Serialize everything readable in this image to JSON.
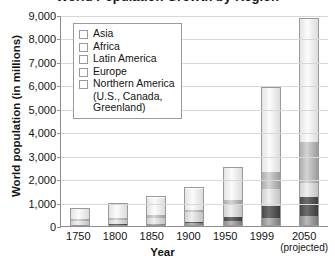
{
  "chart_data": {
    "type": "bar",
    "title": "World Population Growth by Region",
    "xlabel": "Year",
    "ylabel": "World population (in millions)",
    "ylim": [
      0,
      9000
    ],
    "ytick_step": 1000,
    "yticks": [
      "9,000",
      "8,000",
      "7,000",
      "6,000",
      "5,000",
      "4,000",
      "3,000",
      "2,000",
      "1,000",
      "0"
    ],
    "grid": true,
    "stacked": true,
    "legend_position": "upper-left-inside",
    "categories": [
      "1750",
      "1800",
      "1850",
      "1900",
      "1950",
      "1999",
      "2050"
    ],
    "category_sublabels": [
      "",
      "",
      "",
      "",
      "",
      "",
      "(projected)"
    ],
    "series": [
      {
        "name": "Northern America",
        "color": "#8e8e8e",
        "values": [
          2,
          7,
          26,
          82,
          172,
          307,
          392
        ]
      },
      {
        "name": "Latin America",
        "color": "#4a4a4a",
        "values": [
          16,
          24,
          38,
          74,
          167,
          511,
          809
        ]
      },
      {
        "name": "Europe",
        "color": "#d2d2d2",
        "values": [
          163,
          203,
          276,
          408,
          547,
          729,
          628
        ]
      },
      {
        "name": "Africa",
        "color": "#aeaeae",
        "values": [
          106,
          107,
          111,
          133,
          221,
          767,
          1766
        ]
      },
      {
        "name": "Asia",
        "color": "#e4e4e4",
        "values": [
          502,
          635,
          809,
          947,
          1402,
          3634,
          5268
        ]
      }
    ],
    "totals": [
      789,
      976,
      1260,
      1644,
      2509,
      5948,
      8863
    ],
    "legend_entries": [
      {
        "label": "Asia",
        "continuation": ""
      },
      {
        "label": "Africa",
        "continuation": ""
      },
      {
        "label": "Latin America",
        "continuation": ""
      },
      {
        "label": "Europe",
        "continuation": ""
      },
      {
        "label": "Northern America",
        "continuation": "(U.S., Canada,"
      },
      {
        "label": "",
        "continuation": "Greenland)"
      }
    ]
  }
}
